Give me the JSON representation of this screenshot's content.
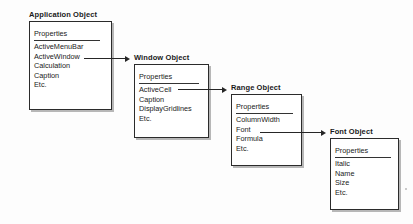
{
  "diagram": {
    "properties_header": "Properties",
    "objects": [
      {
        "id": "application",
        "title": "Application Object",
        "properties": [
          "ActiveMenuBar",
          "ActiveWindow",
          "Calculation",
          "Caption",
          "Etc."
        ]
      },
      {
        "id": "window",
        "title": "Window Object",
        "properties": [
          "ActiveCell",
          "Caption",
          "DisplayGridlines",
          "Etc."
        ]
      },
      {
        "id": "range",
        "title": "Range Object",
        "properties": [
          "ColumnWidth",
          "Font",
          "Formula",
          "Etc."
        ]
      },
      {
        "id": "font",
        "title": "Font Object",
        "properties": [
          "Italic",
          "Name",
          "Size",
          "Etc."
        ]
      }
    ],
    "connectors": [
      {
        "id": "application-to-window",
        "from_property": "ActiveWindow",
        "to_object": "Window Object"
      },
      {
        "id": "window-to-range",
        "from_property": "ActiveCell",
        "to_object": "Range Object"
      },
      {
        "id": "range-to-font",
        "from_property": "Font",
        "to_object": "Font Object"
      }
    ],
    "colors": {
      "background": "#fdfdfd",
      "box_border": "#2b2b2b",
      "box_fill": "#ffffff",
      "text": "#222222",
      "shadow": "#8c8c8c",
      "arrow": "#262626"
    }
  }
}
